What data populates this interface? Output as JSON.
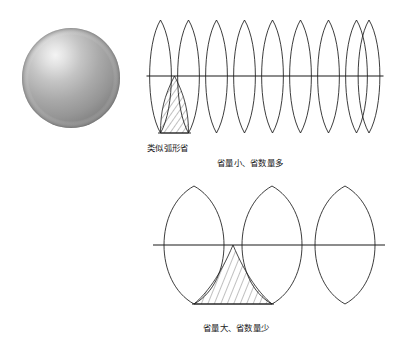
{
  "figure": {
    "title": "",
    "background_color": "#ffffff",
    "stroke_color": "#1a1a1a",
    "sphere": {
      "label": "sphere",
      "center_x": 71,
      "center_y": 78,
      "radius_x": 49,
      "radius_y": 50,
      "highlight_x": 88,
      "highlight_y": 56,
      "highlight_color": "#f2f2f2",
      "mid_color": "#a8a8a8",
      "edge_color": "#6f6f6f"
    },
    "top_row": {
      "petal_count": 9,
      "left": 148,
      "right": 383,
      "top": 20,
      "bottom": 133,
      "equator_y": 76,
      "hatched_region_label": "overlap-gore-top",
      "caption_left": {
        "text": "类似弧形省",
        "x": 147,
        "y": 148
      },
      "caption_right": {
        "text": "省量小、省数量多",
        "x": 217,
        "y": 163
      }
    },
    "bottom_row": {
      "petal_count": 3,
      "left": 148,
      "right": 383,
      "top": 186,
      "bottom": 304,
      "equator_y": 245,
      "hatched_region_label": "overlap-gore-bottom",
      "caption": {
        "text": "省量大、省数量少",
        "x": 203,
        "y": 328
      }
    },
    "hatch": {
      "angle_deg": 25,
      "spacing": 4,
      "color": "#2b2b2b"
    }
  }
}
